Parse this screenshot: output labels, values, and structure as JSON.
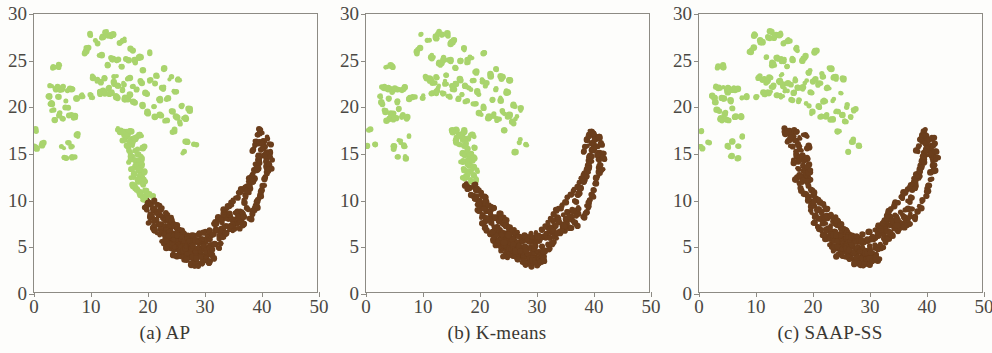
{
  "figure": {
    "background_color": "#fdfdfb",
    "panel_count": 3
  },
  "colors": {
    "cluster_green": "#a9d46d",
    "cluster_brown": "#6b3e1c",
    "axis": "#8d8b84",
    "text": "#4a4843"
  },
  "panels": [
    {
      "caption": "(a) AP"
    },
    {
      "caption": "(b) K-means"
    },
    {
      "caption": "(c) SAAP-SS"
    }
  ],
  "chart_data": {
    "type": "scatter",
    "title": "",
    "xlabel": "",
    "ylabel": "",
    "xlim": [
      0,
      50
    ],
    "ylim": [
      0,
      30
    ],
    "xticks": [
      0,
      10,
      20,
      30,
      40,
      50
    ],
    "yticks": [
      0,
      5,
      10,
      15,
      20,
      25,
      30
    ],
    "grid": false,
    "legend": "none",
    "marker_radius": 2.6,
    "series_names": [
      "cluster_green",
      "cluster_brown"
    ],
    "panels": [
      {
        "name": "(a) AP",
        "description": "Affinity Propagation result: upper-left moon labelled green, lower-right moon labelled brown; the green label additionally claims the descending left arm of the lower moon down to about y=10.",
        "green_claims_left_arm_to_y": 10
      },
      {
        "name": "(b) K-means",
        "description": "K-means result: green cluster covers upper-left moon plus the upper part of the left arm down to about y=12; brown cluster covers the rest of the lower moon.",
        "green_claims_left_arm_to_y": 12
      },
      {
        "name": "(c) SAAP-SS",
        "description": "SAAP-SS result: clean separation, green is exactly the upper-left moon and brown is exactly the lower-right moon; the full left arm up to about y=17.5 is brown.",
        "green_claims_left_arm_to_y": 30
      }
    ],
    "moon_upper_points": [
      [
        0.3,
        15.6
      ],
      [
        0.5,
        17.4
      ],
      [
        1.6,
        16.0
      ],
      [
        2.6,
        21.1
      ],
      [
        2.9,
        20.3
      ],
      [
        3.0,
        22.1
      ],
      [
        3.3,
        19.6
      ],
      [
        3.5,
        24.2
      ],
      [
        3.7,
        21.9
      ],
      [
        3.9,
        18.6
      ],
      [
        4.1,
        22.0
      ],
      [
        4.3,
        20.9
      ],
      [
        4.5,
        24.4
      ],
      [
        4.6,
        19.2
      ],
      [
        4.8,
        21.7
      ],
      [
        5.0,
        15.6
      ],
      [
        5.1,
        18.6
      ],
      [
        5.3,
        22.0
      ],
      [
        5.5,
        14.5
      ],
      [
        5.6,
        20.6
      ],
      [
        5.8,
        19.8
      ],
      [
        6.0,
        16.2
      ],
      [
        6.2,
        21.9
      ],
      [
        6.4,
        19.0
      ],
      [
        6.6,
        22.0
      ],
      [
        6.8,
        15.8
      ],
      [
        7.0,
        14.5
      ],
      [
        7.2,
        18.9
      ],
      [
        7.4,
        20.9
      ],
      [
        7.6,
        16.9
      ],
      [
        8.5,
        21.2
      ],
      [
        9.0,
        25.9
      ],
      [
        9.4,
        26.2
      ],
      [
        9.8,
        27.8
      ],
      [
        10.2,
        21.1
      ],
      [
        10.6,
        23.2
      ],
      [
        11.0,
        27.0
      ],
      [
        11.3,
        22.9
      ],
      [
        11.5,
        21.5
      ],
      [
        11.8,
        25.4
      ],
      [
        12.0,
        22.7
      ],
      [
        12.2,
        27.4
      ],
      [
        12.4,
        21.6
      ],
      [
        12.6,
        23.2
      ],
      [
        12.8,
        28.0
      ],
      [
        13.0,
        22.1
      ],
      [
        13.2,
        24.6
      ],
      [
        13.4,
        27.6
      ],
      [
        13.6,
        21.4
      ],
      [
        13.8,
        25.2
      ],
      [
        14.0,
        22.6
      ],
      [
        14.2,
        27.8
      ],
      [
        14.4,
        23.4
      ],
      [
        14.6,
        21.1
      ],
      [
        14.8,
        25.0
      ],
      [
        15.0,
        22.3
      ],
      [
        15.2,
        26.9
      ],
      [
        15.4,
        21.8
      ],
      [
        15.6,
        24.3
      ],
      [
        15.8,
        27.2
      ],
      [
        16.0,
        22.4
      ],
      [
        16.3,
        20.8
      ],
      [
        16.5,
        25.1
      ],
      [
        16.8,
        23.0
      ],
      [
        17.0,
        21.4
      ],
      [
        17.2,
        26.2
      ],
      [
        17.5,
        22.2
      ],
      [
        17.8,
        20.6
      ],
      [
        18.0,
        24.9
      ],
      [
        18.3,
        21.9
      ],
      [
        18.6,
        25.3
      ],
      [
        18.9,
        22.7
      ],
      [
        19.2,
        20.2
      ],
      [
        19.5,
        23.8
      ],
      [
        19.8,
        21.5
      ],
      [
        20.1,
        19.3
      ],
      [
        20.4,
        22.8
      ],
      [
        20.7,
        25.9
      ],
      [
        21.0,
        20.0
      ],
      [
        21.3,
        22.4
      ],
      [
        21.6,
        18.8
      ],
      [
        21.9,
        23.4
      ],
      [
        22.2,
        20.7
      ],
      [
        22.5,
        19.1
      ],
      [
        22.8,
        22.0
      ],
      [
        23.1,
        24.1
      ],
      [
        23.4,
        18.6
      ],
      [
        23.7,
        20.8
      ],
      [
        24.0,
        23.1
      ],
      [
        24.3,
        19.4
      ],
      [
        24.6,
        17.4
      ],
      [
        24.9,
        21.6
      ],
      [
        25.2,
        19.0
      ],
      [
        25.5,
        23.0
      ],
      [
        25.8,
        18.3
      ],
      [
        26.1,
        20.1
      ],
      [
        26.4,
        15.1
      ],
      [
        26.7,
        18.8
      ],
      [
        27.0,
        16.3
      ],
      [
        27.5,
        19.7
      ],
      [
        28.5,
        15.8
      ]
    ],
    "moon_lower_points": [
      [
        15.0,
        17.5
      ],
      [
        15.4,
        17.2
      ],
      [
        15.8,
        16.3
      ],
      [
        16.1,
        17.4
      ],
      [
        16.4,
        15.8
      ],
      [
        16.7,
        16.9
      ],
      [
        17.0,
        15.1
      ],
      [
        17.2,
        16.4
      ],
      [
        17.4,
        14.7
      ],
      [
        17.6,
        15.9
      ],
      [
        17.8,
        14.2
      ],
      [
        18.0,
        15.3
      ],
      [
        18.2,
        13.6
      ],
      [
        18.4,
        14.8
      ],
      [
        18.6,
        13.1
      ],
      [
        18.8,
        14.2
      ],
      [
        19.0,
        12.5
      ],
      [
        19.2,
        13.6
      ],
      [
        19.4,
        12.0
      ],
      [
        19.6,
        13.0
      ],
      [
        17.3,
        12.2
      ],
      [
        17.6,
        11.6
      ],
      [
        17.9,
        12.6
      ],
      [
        18.2,
        11.1
      ],
      [
        18.5,
        12.0
      ],
      [
        18.8,
        10.6
      ],
      [
        19.1,
        11.5
      ],
      [
        19.4,
        10.2
      ],
      [
        19.7,
        11.0
      ],
      [
        20.0,
        9.8
      ],
      [
        20.2,
        10.6
      ],
      [
        20.5,
        9.4
      ],
      [
        20.8,
        10.2
      ],
      [
        21.0,
        9.0
      ],
      [
        21.3,
        9.8
      ],
      [
        21.6,
        8.6
      ],
      [
        21.9,
        9.4
      ],
      [
        22.2,
        8.2
      ],
      [
        22.5,
        9.0
      ],
      [
        22.8,
        7.9
      ],
      [
        19.3,
        10.0
      ],
      [
        19.6,
        9.3
      ],
      [
        19.9,
        8.7
      ],
      [
        20.3,
        9.6
      ],
      [
        20.6,
        8.2
      ],
      [
        21.0,
        8.9
      ],
      [
        21.4,
        7.8
      ],
      [
        21.8,
        8.5
      ],
      [
        22.2,
        7.4
      ],
      [
        22.6,
        8.1
      ],
      [
        23.0,
        7.0
      ],
      [
        23.4,
        7.7
      ],
      [
        23.8,
        6.6
      ],
      [
        24.2,
        7.3
      ],
      [
        24.6,
        6.2
      ],
      [
        25.0,
        6.9
      ],
      [
        25.4,
        5.8
      ],
      [
        25.8,
        6.5
      ],
      [
        26.2,
        5.4
      ],
      [
        26.6,
        6.1
      ],
      [
        22.9,
        6.8
      ],
      [
        23.3,
        6.2
      ],
      [
        23.7,
        5.7
      ],
      [
        24.1,
        6.4
      ],
      [
        24.5,
        5.2
      ],
      [
        24.9,
        5.9
      ],
      [
        25.3,
        4.8
      ],
      [
        25.7,
        5.5
      ],
      [
        26.1,
        4.4
      ],
      [
        26.5,
        5.1
      ],
      [
        26.9,
        4.1
      ],
      [
        27.3,
        4.8
      ],
      [
        27.7,
        3.7
      ],
      [
        28.1,
        4.4
      ],
      [
        28.5,
        3.4
      ],
      [
        28.9,
        4.1
      ],
      [
        29.3,
        3.2
      ],
      [
        29.7,
        3.9
      ],
      [
        30.1,
        3.4
      ],
      [
        30.5,
        4.1
      ],
      [
        24.0,
        4.6
      ],
      [
        24.4,
        4.0
      ],
      [
        24.8,
        4.5
      ],
      [
        25.2,
        3.9
      ],
      [
        25.6,
        4.4
      ],
      [
        26.0,
        3.8
      ],
      [
        26.4,
        4.3
      ],
      [
        26.8,
        3.6
      ],
      [
        27.2,
        4.2
      ],
      [
        27.6,
        3.1
      ],
      [
        28.0,
        3.8
      ],
      [
        28.4,
        3.0
      ],
      [
        28.8,
        3.7
      ],
      [
        29.2,
        2.9
      ],
      [
        29.6,
        3.6
      ],
      [
        30.0,
        3.0
      ],
      [
        30.4,
        3.7
      ],
      [
        30.8,
        3.2
      ],
      [
        31.2,
        3.9
      ],
      [
        31.6,
        3.5
      ],
      [
        23.5,
        8.4
      ],
      [
        24.0,
        8.0
      ],
      [
        24.5,
        7.6
      ],
      [
        25.0,
        7.2
      ],
      [
        25.5,
        6.9
      ],
      [
        26.0,
        6.6
      ],
      [
        26.5,
        6.3
      ],
      [
        27.0,
        6.0
      ],
      [
        27.5,
        5.8
      ],
      [
        28.0,
        5.6
      ],
      [
        28.5,
        5.5
      ],
      [
        29.0,
        5.4
      ],
      [
        29.5,
        5.4
      ],
      [
        30.0,
        5.5
      ],
      [
        30.5,
        5.6
      ],
      [
        31.0,
        5.8
      ],
      [
        31.5,
        6.0
      ],
      [
        32.0,
        6.3
      ],
      [
        32.5,
        6.6
      ],
      [
        33.0,
        6.9
      ],
      [
        22.6,
        5.6
      ],
      [
        23.1,
        5.2
      ],
      [
        23.6,
        4.9
      ],
      [
        24.1,
        5.4
      ],
      [
        24.6,
        5.0
      ],
      [
        25.1,
        5.6
      ],
      [
        25.6,
        5.2
      ],
      [
        26.1,
        5.8
      ],
      [
        26.6,
        5.3
      ],
      [
        27.1,
        5.9
      ],
      [
        27.6,
        5.4
      ],
      [
        28.1,
        6.0
      ],
      [
        28.6,
        5.6
      ],
      [
        29.1,
        6.2
      ],
      [
        29.6,
        5.8
      ],
      [
        30.1,
        6.4
      ],
      [
        30.6,
        6.0
      ],
      [
        31.1,
        6.6
      ],
      [
        31.6,
        6.2
      ],
      [
        32.1,
        6.8
      ],
      [
        32.6,
        5.9
      ],
      [
        33.1,
        6.5
      ],
      [
        33.6,
        7.0
      ],
      [
        34.1,
        6.4
      ],
      [
        34.6,
        7.1
      ],
      [
        35.1,
        6.7
      ],
      [
        35.6,
        7.4
      ],
      [
        36.1,
        7.0
      ],
      [
        36.6,
        7.7
      ],
      [
        37.1,
        7.3
      ],
      [
        33.2,
        7.6
      ],
      [
        33.7,
        8.1
      ],
      [
        34.2,
        7.7
      ],
      [
        34.7,
        8.3
      ],
      [
        35.2,
        7.9
      ],
      [
        35.7,
        8.5
      ],
      [
        36.2,
        8.1
      ],
      [
        36.7,
        8.8
      ],
      [
        37.2,
        8.3
      ],
      [
        37.7,
        9.0
      ],
      [
        31.8,
        7.2
      ],
      [
        32.3,
        7.5
      ],
      [
        32.8,
        7.9
      ],
      [
        33.3,
        8.4
      ],
      [
        33.8,
        8.8
      ],
      [
        34.3,
        9.1
      ],
      [
        34.8,
        9.5
      ],
      [
        35.3,
        9.8
      ],
      [
        35.8,
        10.2
      ],
      [
        36.3,
        10.6
      ],
      [
        36.8,
        11.0
      ],
      [
        37.3,
        11.4
      ],
      [
        37.8,
        11.8
      ],
      [
        38.2,
        12.2
      ],
      [
        38.6,
        12.7
      ],
      [
        38.9,
        13.2
      ],
      [
        39.2,
        13.7
      ],
      [
        39.5,
        14.2
      ],
      [
        39.7,
        14.7
      ],
      [
        39.9,
        15.2
      ],
      [
        37.0,
        9.8
      ],
      [
        37.4,
        10.3
      ],
      [
        37.8,
        10.8
      ],
      [
        38.2,
        11.3
      ],
      [
        38.5,
        11.9
      ],
      [
        38.8,
        12.4
      ],
      [
        39.1,
        13.0
      ],
      [
        39.4,
        13.5
      ],
      [
        39.6,
        14.1
      ],
      [
        39.8,
        14.6
      ],
      [
        38.3,
        8.0
      ],
      [
        38.8,
        8.6
      ],
      [
        39.2,
        9.2
      ],
      [
        39.6,
        9.8
      ],
      [
        40.0,
        10.4
      ],
      [
        40.3,
        11.0
      ],
      [
        40.6,
        11.6
      ],
      [
        40.9,
        12.3
      ],
      [
        41.1,
        12.9
      ],
      [
        41.3,
        13.5
      ],
      [
        38.6,
        15.2
      ],
      [
        38.9,
        15.8
      ],
      [
        39.2,
        16.4
      ],
      [
        39.5,
        16.9
      ],
      [
        39.8,
        17.4
      ],
      [
        40.2,
        17.0
      ],
      [
        40.5,
        16.4
      ],
      [
        40.8,
        15.8
      ],
      [
        41.0,
        15.2
      ],
      [
        41.2,
        14.6
      ],
      [
        40.0,
        16.0
      ],
      [
        40.4,
        15.4
      ],
      [
        40.7,
        14.8
      ],
      [
        41.0,
        14.2
      ],
      [
        41.3,
        16.7
      ],
      [
        41.6,
        15.9
      ],
      [
        41.9,
        15.1
      ],
      [
        42.0,
        14.4
      ],
      [
        41.5,
        13.8
      ],
      [
        41.7,
        13.2
      ],
      [
        20.5,
        7.4
      ],
      [
        21.0,
        7.0
      ],
      [
        21.5,
        6.6
      ],
      [
        22.0,
        6.2
      ],
      [
        22.5,
        6.6
      ],
      [
        23.0,
        6.1
      ],
      [
        23.5,
        5.6
      ],
      [
        24.0,
        6.0
      ],
      [
        24.5,
        5.5
      ],
      [
        25.0,
        6.2
      ],
      [
        25.5,
        4.6
      ],
      [
        26.0,
        4.9
      ],
      [
        26.5,
        4.5
      ],
      [
        27.0,
        4.9
      ],
      [
        27.5,
        4.4
      ],
      [
        28.0,
        4.8
      ],
      [
        28.5,
        4.3
      ],
      [
        29.0,
        4.7
      ],
      [
        29.5,
        4.3
      ],
      [
        30.0,
        4.8
      ],
      [
        30.5,
        4.4
      ],
      [
        31.0,
        4.9
      ],
      [
        31.5,
        4.5
      ],
      [
        32.0,
        5.1
      ],
      [
        32.5,
        4.7
      ],
      [
        33.0,
        5.3
      ],
      [
        33.5,
        5.9
      ],
      [
        34.0,
        6.2
      ],
      [
        34.5,
        6.8
      ],
      [
        35.0,
        7.2
      ],
      [
        18.9,
        16.9
      ],
      [
        19.3,
        15.6
      ],
      [
        19.1,
        14.5
      ],
      [
        18.7,
        17.0
      ],
      [
        17.9,
        16.6
      ],
      [
        17.1,
        17.3
      ],
      [
        16.2,
        16.8
      ],
      [
        15.6,
        17.3
      ],
      [
        16.9,
        14.1
      ],
      [
        17.4,
        13.2
      ]
    ]
  }
}
